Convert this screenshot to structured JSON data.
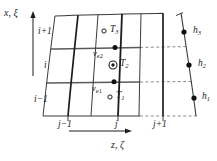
{
  "figure": {
    "type": "grid-diagram",
    "axes": {
      "vertical": {
        "label_1": "x",
        "separator": ",",
        "label_2": "ξ",
        "arrow": "up"
      },
      "horizontal": {
        "label_1": "z",
        "separator": ",",
        "label_2": "ζ",
        "arrow": "right"
      }
    },
    "row_indices": [
      {
        "id": "i-plus-1",
        "label_base": "i",
        "label_suffix": "+1",
        "text": "i+1"
      },
      {
        "id": "i",
        "label_base": "i",
        "label_suffix": "",
        "text": "i"
      },
      {
        "id": "i-minus-1",
        "label_base": "i",
        "label_suffix": "−1",
        "text": "i−1"
      }
    ],
    "col_indices": [
      {
        "id": "j-minus-1",
        "text": "j−1",
        "base": "j",
        "suffix": "−1"
      },
      {
        "id": "j",
        "text": "j",
        "base": "j",
        "suffix": ""
      },
      {
        "id": "j-plus-1",
        "text": "j+1",
        "base": "j",
        "suffix": "+1"
      }
    ],
    "nodes": [
      {
        "id": "T3",
        "base": "T",
        "sub": "3",
        "marker": "open-circle"
      },
      {
        "id": "T2",
        "base": "T",
        "sub": "2",
        "marker": "double-circle"
      },
      {
        "id": "T1",
        "base": "T",
        "sub": "1",
        "marker": "open-circle"
      },
      {
        "id": "nu-e2",
        "base": "ν",
        "sub": "e2",
        "marker": "filled-dot"
      },
      {
        "id": "nu-e1",
        "base": "ν",
        "sub": "e1",
        "marker": "filled-dot"
      },
      {
        "id": "h3",
        "base": "h",
        "sub": "3",
        "marker": "filled-dot"
      },
      {
        "id": "h2",
        "base": "h",
        "sub": "2",
        "marker": "filled-dot"
      },
      {
        "id": "h1",
        "base": "h",
        "sub": "1",
        "marker": "filled-dot"
      }
    ],
    "colors": {
      "line": "#1d1d1d",
      "gridline_thin": "#3a3a3a",
      "horizontal_rule": "#555555",
      "dashed": "#8a8a8a",
      "background": "#ffffff"
    }
  }
}
